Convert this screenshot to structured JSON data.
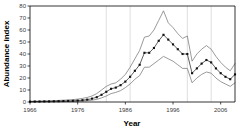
{
  "chart_data": {
    "type": "line",
    "title": "",
    "xlabel": "Year",
    "ylabel": "Abundance index",
    "xlim": [
      1966,
      2009
    ],
    "ylim": [
      0,
      80
    ],
    "yticks": [
      0,
      10,
      20,
      30,
      40,
      50,
      60,
      70,
      80
    ],
    "ytick_labels": [
      "0",
      "10",
      "20",
      "30",
      "40",
      "50",
      "60",
      "70",
      "80"
    ],
    "xticks": [
      1966,
      1976,
      1986,
      1996,
      2006
    ],
    "xtick_labels": [
      "1966",
      "1976",
      "1986",
      "1996",
      "2006"
    ],
    "grid": "vertical-faint",
    "gridline_x": [
      1982,
      1987,
      1999,
      2004
    ],
    "legend": "none",
    "x": [
      1966,
      1967,
      1968,
      1969,
      1970,
      1971,
      1972,
      1973,
      1974,
      1975,
      1976,
      1977,
      1978,
      1979,
      1980,
      1981,
      1982,
      1983,
      1984,
      1985,
      1986,
      1987,
      1988,
      1989,
      1990,
      1991,
      1992,
      1993,
      1994,
      1995,
      1996,
      1997,
      1998,
      1999,
      2000,
      2001,
      2002,
      2003,
      2004,
      2005,
      2006,
      2007,
      2008,
      2009
    ],
    "series": [
      {
        "name": "Abundance index",
        "style": "line-with-square-markers",
        "color": "#111111",
        "values": [
          0.3,
          0.4,
          0.4,
          0.5,
          0.5,
          0.6,
          0.7,
          0.8,
          0.9,
          1.0,
          1.2,
          1.5,
          2.0,
          2.8,
          4.0,
          6.0,
          8.5,
          11.0,
          12.0,
          14.0,
          17.0,
          21.0,
          26.0,
          31.0,
          41.0,
          41.0,
          45.0,
          51.0,
          56.0,
          52.0,
          48.0,
          44.0,
          40.0,
          40.0,
          24.0,
          28.0,
          32.0,
          35.0,
          33.0,
          28.0,
          24.0,
          21.0,
          19.0,
          23.0
        ]
      },
      {
        "name": "Upper confidence limit",
        "style": "thin-line",
        "color": "#6f6f6f",
        "values": [
          0.6,
          0.7,
          0.8,
          0.9,
          1.0,
          1.1,
          1.3,
          1.5,
          1.7,
          2.0,
          2.4,
          3.0,
          3.8,
          5.0,
          7.0,
          10.0,
          13.0,
          15.0,
          16.0,
          19.0,
          23.0,
          29.0,
          36.0,
          43.0,
          54.0,
          55.0,
          60.0,
          68.0,
          76.0,
          66.0,
          62.0,
          57.0,
          53.0,
          55.0,
          34.0,
          40.0,
          44.0,
          47.0,
          44.0,
          38.0,
          33.0,
          29.0,
          26.0,
          32.0
        ]
      },
      {
        "name": "Lower confidence limit",
        "style": "thin-line",
        "color": "#6f6f6f",
        "values": [
          0.1,
          0.1,
          0.2,
          0.2,
          0.2,
          0.3,
          0.3,
          0.4,
          0.4,
          0.5,
          0.6,
          0.8,
          1.1,
          1.5,
          2.2,
          3.4,
          5.0,
          7.0,
          8.0,
          9.5,
          12.0,
          15.0,
          19.0,
          22.0,
          29.0,
          29.0,
          32.0,
          35.0,
          38.0,
          36.0,
          34.0,
          31.0,
          28.0,
          28.0,
          16.0,
          20.0,
          23.0,
          25.0,
          24.0,
          20.0,
          17.0,
          15.0,
          13.0,
          16.0
        ]
      }
    ]
  }
}
